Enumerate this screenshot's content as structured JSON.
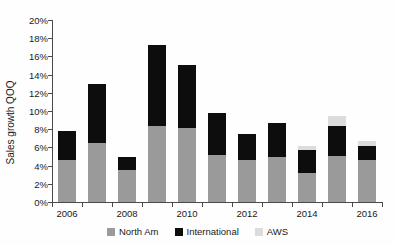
{
  "chart_data": {
    "type": "bar",
    "stacked": true,
    "title": "",
    "xlabel": "",
    "ylabel": "Sales growth QOQ",
    "ylim": [
      0,
      20
    ],
    "ytick_values": [
      0,
      2,
      4,
      6,
      8,
      10,
      12,
      14,
      16,
      18,
      20
    ],
    "ytick_labels": [
      "0%",
      "2%",
      "4%",
      "6%",
      "8%",
      "10%",
      "12%",
      "14%",
      "16%",
      "18%",
      "20%"
    ],
    "grid": false,
    "legend_position": "bottom",
    "categories": [
      "2006",
      "2007",
      "2008",
      "2009",
      "2010",
      "2011",
      "2012",
      "2013",
      "2014",
      "2015",
      "2016"
    ],
    "xtick_labels": [
      "2006",
      "",
      "2008",
      "",
      "2010",
      "",
      "2012",
      "",
      "2014",
      "",
      "2016"
    ],
    "series": [
      {
        "name": "North Am",
        "color": "#9a9a9a",
        "values": [
          4.6,
          6.5,
          3.5,
          8.4,
          8.1,
          5.2,
          4.6,
          5.0,
          3.2,
          5.1,
          4.6
        ]
      },
      {
        "name": "International",
        "color": "#0d0d0d",
        "values": [
          3.2,
          6.5,
          1.5,
          8.9,
          7.0,
          4.6,
          2.9,
          3.7,
          2.5,
          3.3,
          1.6
        ]
      },
      {
        "name": "AWS",
        "color": "#dcdcdc",
        "values": [
          0,
          0,
          0,
          0,
          0,
          0,
          0,
          0,
          0.5,
          1.0,
          0.5
        ]
      }
    ],
    "totals": [
      7.8,
      13.0,
      5.0,
      17.3,
      15.1,
      9.8,
      7.5,
      8.7,
      6.2,
      9.4,
      6.7
    ]
  },
  "legend": {
    "items": [
      {
        "label": "North Am",
        "color": "#9a9a9a"
      },
      {
        "label": "International",
        "color": "#0d0d0d"
      },
      {
        "label": "AWS",
        "color": "#dcdcdc"
      }
    ]
  }
}
